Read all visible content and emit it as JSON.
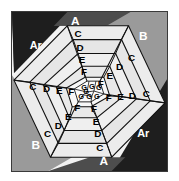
{
  "figure": {
    "background_color": "#ffffff",
    "plate_border_color": "#3a3a3a",
    "plate_fill_color": "#f2f2f2"
  },
  "palette": {
    "corner_darkest": "#1e1e1e",
    "corner_dark": "#4d4d4d",
    "corner_mid": "#9a9a9a",
    "ring_light": "#efefef",
    "ring_pale": "#e3e3e3",
    "ring_paler": "#dcdcdc",
    "ring_white": "#f7f7f7",
    "core_white": "#fbfbfb",
    "stroke": "#111111",
    "label_on_dark": "#ffffff",
    "label_on_light": "#000000"
  },
  "corners": [
    {
      "key": "corner-top-left-ar",
      "label": "Ar",
      "fill_key": "corner_darkest",
      "label_color": "#ffffff",
      "x": 30,
      "y": 40
    },
    {
      "key": "corner-top-left-a",
      "label": "A",
      "fill_key": "corner_dark",
      "label_color": "#ffffff",
      "x": 72,
      "y": 20
    },
    {
      "key": "corner-top-right-b",
      "label": "B",
      "fill_key": "corner_mid",
      "label_color": "#ffffff",
      "x": 133,
      "y": 31
    },
    {
      "key": "corner-bottom-right-ar",
      "label": "Ar",
      "fill_key": "corner_darkest",
      "label_color": "#ffffff",
      "x": 131,
      "y": 124
    },
    {
      "key": "corner-bottom-right-a",
      "label": "A",
      "fill_key": "corner_dark",
      "label_color": "#ffffff",
      "x": 88,
      "y": 145
    },
    {
      "key": "corner-bottom-left-b",
      "label": "B",
      "fill_key": "corner_mid",
      "label_color": "#ffffff",
      "x": 27,
      "y": 134
    }
  ],
  "rings": [
    {
      "key": "ring-c",
      "label": "C",
      "index": 0
    },
    {
      "key": "ring-d",
      "label": "D",
      "index": 1
    },
    {
      "key": "ring-e",
      "label": "E",
      "index": 2
    },
    {
      "key": "ring-f",
      "label": "F",
      "index": 3
    },
    {
      "key": "ring-g",
      "label": "G",
      "index": 4
    }
  ],
  "ring_labels": [
    {
      "key": "lbl-c-top",
      "text": "C",
      "x": 67,
      "y": 32
    },
    {
      "key": "lbl-d-top",
      "text": "D",
      "x": 68,
      "y": 47
    },
    {
      "key": "lbl-e-top",
      "text": "E",
      "x": 70,
      "y": 61
    },
    {
      "key": "lbl-f-top",
      "text": "F",
      "x": 72,
      "y": 74
    },
    {
      "key": "lbl-c-left",
      "text": "C",
      "x": 24,
      "y": 77
    },
    {
      "key": "lbl-d-left",
      "text": "D",
      "x": 38,
      "y": 79
    },
    {
      "key": "lbl-e-left",
      "text": "E",
      "x": 51,
      "y": 80
    },
    {
      "key": "lbl-f-left",
      "text": "F",
      "x": 63,
      "y": 82
    },
    {
      "key": "lbl-c-right",
      "text": "C",
      "x": 132,
      "y": 84
    },
    {
      "key": "lbl-d-right",
      "text": "D",
      "x": 119,
      "y": 86
    },
    {
      "key": "lbl-e-right",
      "text": "E",
      "x": 107,
      "y": 87
    },
    {
      "key": "lbl-f-right",
      "text": "F",
      "x": 95,
      "y": 89
    },
    {
      "key": "lbl-c-bottom",
      "text": "C",
      "x": 89,
      "y": 135
    },
    {
      "key": "lbl-d-bottom",
      "text": "D",
      "x": 88,
      "y": 121
    },
    {
      "key": "lbl-e-bottom",
      "text": "E",
      "x": 86,
      "y": 107
    },
    {
      "key": "lbl-f-bottom",
      "text": "F",
      "x": 84,
      "y": 94
    },
    {
      "key": "lbl-c-ne",
      "text": "C",
      "x": 118,
      "y": 45
    },
    {
      "key": "lbl-d-ne",
      "text": "D",
      "x": 106,
      "y": 53
    },
    {
      "key": "lbl-e-ne",
      "text": "E",
      "x": 96,
      "y": 62
    },
    {
      "key": "lbl-f-ne",
      "text": "F",
      "x": 88,
      "y": 70
    },
    {
      "key": "lbl-c-sw",
      "text": "C",
      "x": 38,
      "y": 122
    },
    {
      "key": "lbl-d-sw",
      "text": "D",
      "x": 49,
      "y": 113
    },
    {
      "key": "lbl-e-sw",
      "text": "E",
      "x": 59,
      "y": 104
    },
    {
      "key": "lbl-f-sw",
      "text": "F",
      "x": 67,
      "y": 95
    },
    {
      "key": "lbl-g-1",
      "text": "G",
      "x": 73,
      "y": 78
    },
    {
      "key": "lbl-g-2",
      "text": "G",
      "x": 81,
      "y": 76
    },
    {
      "key": "lbl-g-3",
      "text": "G",
      "x": 70,
      "y": 85
    },
    {
      "key": "lbl-g-4",
      "text": "G",
      "x": 78,
      "y": 84
    },
    {
      "key": "lbl-g-5",
      "text": "G",
      "x": 86,
      "y": 82
    },
    {
      "key": "lbl-g-6",
      "text": "G",
      "x": 75,
      "y": 91
    },
    {
      "key": "lbl-g-7",
      "text": "G",
      "x": 83,
      "y": 90
    }
  ],
  "legend_order": [
    "Ar",
    "A",
    "B",
    "C",
    "D",
    "E",
    "F",
    "G"
  ]
}
